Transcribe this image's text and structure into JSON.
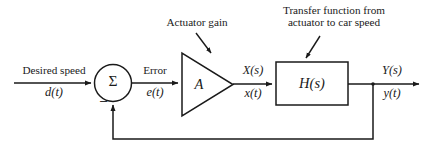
{
  "figure": {
    "type": "block-diagram",
    "background_color": "#ffffff",
    "line_color": "#1a1a1a"
  },
  "annotations": {
    "actuator_gain": "Actuator gain",
    "transfer_function_line1": "Transfer function from",
    "transfer_function_line2": "actuator to car speed"
  },
  "signals": {
    "input_name": "Desired speed",
    "input_time": "d(t)",
    "error_name": "Error",
    "error_time": "e(t)",
    "actuator_laplace": "X(s)",
    "actuator_time": "x(t)",
    "output_laplace": "Y(s)",
    "output_time": "y(t)"
  },
  "blocks": {
    "summing_junction_symbol": "Σ",
    "summing_junction_negative_sign": "–",
    "amplifier_label": "A",
    "plant_label": "H(s)"
  }
}
